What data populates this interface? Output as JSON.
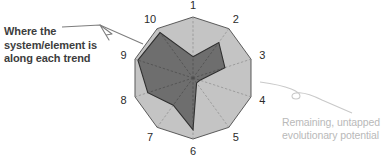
{
  "diagram": {
    "title": "",
    "type": "radar",
    "callout_left": "Where the system/element is along each trend",
    "callout_right": "Remaining, untapped evolutionary potential",
    "colors": {
      "inner_fill": "#6e6e6e",
      "outer_fill": "#c4c4c4",
      "outline": "#3a3a3a",
      "spoke": "#8c8c8c",
      "label_text": "#2b2b2b",
      "left_text": "#3d3d3d",
      "right_text": "#b9b9b9",
      "pointer_left": "#7d7d7d",
      "pointer_right": "#c9c9c9",
      "background": "#ffffff"
    }
  },
  "chart_data": {
    "type": "radar",
    "title": "",
    "xlabel": "",
    "ylabel": "",
    "rlim": [
      0,
      1
    ],
    "grid": false,
    "legend_position": "callouts",
    "categories": [
      "1",
      "2",
      "3",
      "4",
      "5",
      "6",
      "7",
      "8",
      "9",
      "10"
    ],
    "series": [
      {
        "name": "Where the system/element is along each trend",
        "fill": "#6e6e6e",
        "values": [
          0.35,
          0.72,
          0.55,
          0.12,
          0.1,
          0.85,
          0.55,
          0.78,
          0.95,
          0.92
        ]
      },
      {
        "name": "Remaining, untapped evolutionary potential",
        "fill": "#c4c4c4",
        "values": [
          1.0,
          1.0,
          1.0,
          1.0,
          1.0,
          1.0,
          1.0,
          1.0,
          1.0,
          1.0
        ]
      }
    ],
    "annotations": [
      "Where the system/element is along each trend",
      "Remaining, untapped evolutionary potential"
    ]
  },
  "geometry": {
    "center_x": 193,
    "center_y": 78,
    "radius": 61,
    "label_radius": 73,
    "axis_count": 10,
    "start_angle_deg": -90
  }
}
